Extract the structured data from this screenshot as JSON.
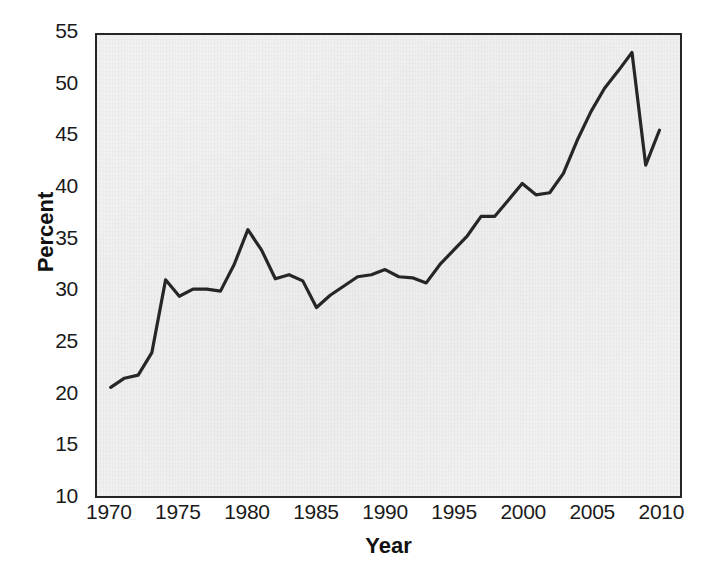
{
  "chart_data": {
    "type": "line",
    "title": "",
    "xlabel": "Year",
    "ylabel": "Percent",
    "xlim": [
      1969,
      2011.5
    ],
    "ylim": [
      10,
      55
    ],
    "grid": false,
    "legend": "none",
    "xticks": [
      1970,
      1975,
      1980,
      1985,
      1990,
      1995,
      2000,
      2005,
      2010
    ],
    "xtick_labels": [
      "1970",
      "1975",
      "1980",
      "1985",
      "1990",
      "1995",
      "2000",
      "2005",
      "2010"
    ],
    "yticks": [
      10,
      15,
      20,
      25,
      30,
      35,
      40,
      45,
      50,
      55
    ],
    "ytick_labels": [
      "10",
      "15",
      "20",
      "25",
      "30",
      "35",
      "40",
      "45",
      "50",
      "55"
    ],
    "line_color": "#262626",
    "background_color": "#f1f1f1",
    "page_color": "#ffffff",
    "x": [
      1970,
      1971,
      1972,
      1973,
      1974,
      1975,
      1976,
      1977,
      1978,
      1979,
      1980,
      1981,
      1982,
      1983,
      1984,
      1985,
      1986,
      1987,
      1988,
      1989,
      1990,
      1991,
      1992,
      1993,
      1994,
      1995,
      1996,
      1997,
      1998,
      1999,
      2000,
      2001,
      2002,
      2003,
      2004,
      2005,
      2006,
      2007,
      2008,
      2009,
      2010
    ],
    "values": [
      20.6,
      21.5,
      21.8,
      24.0,
      31.1,
      29.5,
      30.2,
      30.2,
      30.0,
      32.6,
      36.0,
      34.0,
      31.2,
      31.6,
      31.0,
      28.4,
      29.6,
      30.5,
      31.4,
      31.6,
      32.1,
      31.4,
      31.3,
      30.8,
      32.6,
      34.0,
      35.4,
      37.3,
      37.3,
      38.9,
      40.5,
      39.4,
      39.6,
      41.5,
      44.7,
      47.5,
      49.8,
      51.5,
      53.3,
      42.3,
      45.7
    ]
  }
}
